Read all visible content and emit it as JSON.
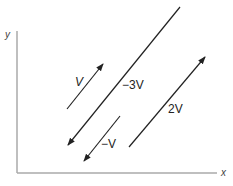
{
  "diagram": {
    "axes": {
      "x_label": "x",
      "y_label": "y"
    },
    "vectors": [
      {
        "label": "V",
        "direction": "up-right"
      },
      {
        "label": "−3V",
        "direction": "down-left"
      },
      {
        "label": "−V",
        "direction": "down-left"
      },
      {
        "label": "2V",
        "direction": "up-right"
      }
    ]
  }
}
